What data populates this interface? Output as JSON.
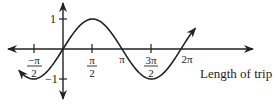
{
  "diagram": {
    "type": "sine-graph",
    "function": "y = sin(x)",
    "x_axis_label": "Length of trip",
    "y_ticks": [
      {
        "value": 1,
        "label": "1"
      },
      {
        "value": -1,
        "label": "−1"
      }
    ],
    "x_ticks": [
      {
        "value": "-pi/2",
        "num": "−π",
        "den": "2"
      },
      {
        "value": "pi/2",
        "num": "π",
        "den": "2"
      },
      {
        "value": "pi",
        "label": "π"
      },
      {
        "value": "3pi/2",
        "num": "3π",
        "den": "2"
      },
      {
        "value": "2pi",
        "label": "2π"
      }
    ],
    "domain_shown": [
      "-3pi/4 (approx)",
      "9pi/4 (approx)"
    ],
    "colors": {
      "line": "#222222",
      "background": "#ffffff"
    }
  }
}
